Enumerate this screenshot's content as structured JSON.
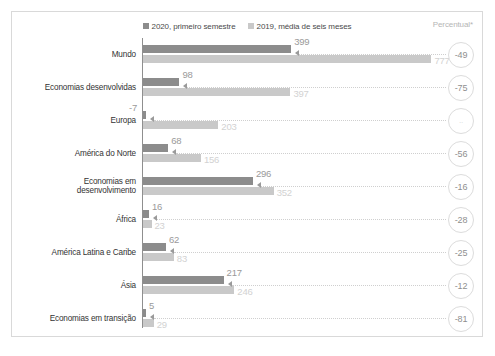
{
  "legend": {
    "items": [
      {
        "label": "2020, primeiro semestre",
        "color": "#8c8c8c",
        "swatch": "square-swatch-dark"
      },
      {
        "label": "2019, média de seis meses",
        "color": "#c9c9c9",
        "swatch": "square-swatch-light"
      }
    ]
  },
  "axis_note": "Percentual*",
  "chart_data": {
    "type": "bar",
    "orientation": "horizontal",
    "title": "",
    "subtitle": "",
    "xlabel": "",
    "ylabel": "",
    "grid": false,
    "legend_position": "top-center",
    "xlim": [
      0,
      800
    ],
    "categories": [
      "Mundo",
      "Economias desenvolvidas",
      "Europa",
      "América do Norte",
      "Economias em\ndesenvolvimento",
      "África",
      "América Latina e Caribe",
      "Ásia",
      "Economias em transição"
    ],
    "series": [
      {
        "name": "2020, primeiro semestre",
        "color": "#8c8c8c",
        "values": [
          399,
          98,
          -7,
          68,
          296,
          16,
          62,
          217,
          5
        ]
      },
      {
        "name": "2019, média de seis meses",
        "color": "#c9c9c9",
        "values": [
          777,
          397,
          203,
          156,
          352,
          23,
          83,
          246,
          29
        ]
      }
    ],
    "annotations": {
      "percent_change_label": "Percentual*",
      "percent_change": [
        "-49",
        "-75",
        "..",
        "-56",
        "-16",
        "-28",
        "-25",
        "-12",
        "-81"
      ]
    }
  },
  "rows": [
    {
      "category": "Mundo",
      "v2020": "399",
      "v2019": "777",
      "pct": "-49",
      "pct_faint": false
    },
    {
      "category": "Economias desenvolvidas",
      "v2020": "98",
      "v2019": "397",
      "pct": "-75",
      "pct_faint": false
    },
    {
      "category": "Europa",
      "v2020": "-7",
      "v2019": "203",
      "pct": "..",
      "pct_faint": true
    },
    {
      "category": "América do Norte",
      "v2020": "68",
      "v2019": "156",
      "pct": "-56",
      "pct_faint": false
    },
    {
      "category": "Economias em\ndesenvolvimento",
      "v2020": "296",
      "v2019": "352",
      "pct": "-16",
      "pct_faint": false
    },
    {
      "category": "África",
      "v2020": "16",
      "v2019": "23",
      "pct": "-28",
      "pct_faint": false
    },
    {
      "category": "América Latina e Caribe",
      "v2020": "62",
      "v2019": "83",
      "pct": "-25",
      "pct_faint": false
    },
    {
      "category": "Ásia",
      "v2020": "217",
      "v2019": "246",
      "pct": "-12",
      "pct_faint": false
    },
    {
      "category": "Economias em transição",
      "v2020": "5",
      "v2019": "29",
      "pct": "-81",
      "pct_faint": false
    }
  ]
}
